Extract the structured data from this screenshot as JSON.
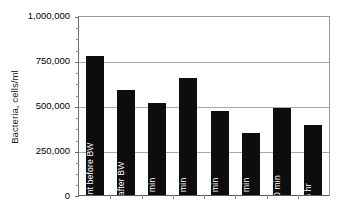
{
  "chart_data": {
    "type": "bar",
    "title": "",
    "xlabel": "",
    "ylabel": "Bacteria, cells/ml",
    "ylim": [
      0,
      1000000
    ],
    "ytick_values": [
      1000000,
      750000,
      500000,
      250000,
      0
    ],
    "ytick_labels": [
      "1,000,000",
      "750,000",
      "500,000",
      "250,000",
      "0"
    ],
    "grid": true,
    "legend": "none",
    "bar_color": "#0d0d0d",
    "bar_label_color": "#ffffff",
    "categories": [
      "Filter Effluent before BW",
      "0 min after BW",
      "15 min",
      "30 min",
      "45 min",
      "60 min",
      "120 min",
      "6 hr"
    ],
    "values": [
      775000,
      585000,
      515000,
      655000,
      472000,
      345000,
      487000,
      390000
    ],
    "series": [
      {
        "name": "Bacteria, cells/ml",
        "values": [
          775000,
          585000,
          515000,
          655000,
          472000,
          345000,
          487000,
          390000
        ]
      }
    ]
  }
}
